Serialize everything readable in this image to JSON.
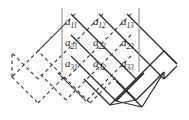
{
  "figure": {
    "colors": {
      "solid_line": "#2b2b2b",
      "dashed_line": "#3a3a3a",
      "bar": "#8c8c8c",
      "text": "#1a1a1a",
      "background": "#ffffff"
    },
    "matrix": {
      "rows": 3,
      "cols": 3,
      "left_bar_label": "|",
      "right_bar_label": "|",
      "entries": [
        {
          "name": "a11",
          "base": "a",
          "sub": "11",
          "x": 65,
          "y": 17,
          "row": 1,
          "col": 1
        },
        {
          "name": "a12",
          "base": "a",
          "sub": "12",
          "x": 93,
          "y": 17,
          "row": 1,
          "col": 2
        },
        {
          "name": "a13",
          "base": "a",
          "sub": "13",
          "x": 121,
          "y": 17,
          "row": 1,
          "col": 3
        },
        {
          "name": "a21",
          "base": "a",
          "sub": "21",
          "x": 65,
          "y": 38,
          "row": 2,
          "col": 1
        },
        {
          "name": "a22",
          "base": "a",
          "sub": "22",
          "x": 93,
          "y": 38,
          "row": 2,
          "col": 2
        },
        {
          "name": "a23",
          "base": "a",
          "sub": "23",
          "x": 121,
          "y": 38,
          "row": 2,
          "col": 3
        },
        {
          "name": "a31",
          "base": "a",
          "sub": "31",
          "x": 65,
          "y": 59,
          "row": 3,
          "col": 1
        },
        {
          "name": "a32",
          "base": "a",
          "sub": "32",
          "x": 93,
          "y": 59,
          "row": 3,
          "col": 2
        },
        {
          "name": "a33",
          "base": "a",
          "sub": "33",
          "x": 121,
          "y": 59,
          "row": 3,
          "col": 3
        }
      ],
      "left_bar": {
        "x": 62,
        "y1": 8,
        "y2": 72
      },
      "right_bar": {
        "x": 139,
        "y1": 8,
        "y2": 72
      }
    },
    "solid_paths": [
      "M 62,14 L 120,72",
      "M 62,35 L 120,93",
      "M 62,56 L 120,114",
      "M 90,14 L 148,72",
      "M 118,14 L 176,72",
      "M 120,72 L 148,44",
      "M 120,93 L 148,65",
      "M 120,114 L 148,86",
      "M 148,72 L 176,44",
      "M 148,86 L 176,58",
      "M 176,44 L 176,44",
      "M 148,44 L 176,16",
      "M 176,58 L 148,86"
    ],
    "dashed_paths": [
      "M 120,14 L 62,72",
      "M 120,35 L 62,93",
      "M 120,56 L 62,114",
      "M 92,14 L 34,72",
      "M 64,14 L 6,72",
      "M 62,72 L 34,44",
      "M 62,93 L 34,65",
      "M 62,114 L 34,86",
      "M 34,72 L 6,44",
      "M 34,86 L 6,58"
    ]
  }
}
